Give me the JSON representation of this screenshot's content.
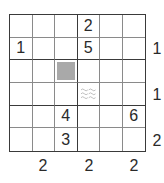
{
  "puzzle": {
    "rows": 6,
    "cols": 6,
    "box_rows": 2,
    "box_cols": 3,
    "colors": {
      "grid_line_thick": "#3a3a3a",
      "grid_line_thin": "#8a8a8a",
      "shaded_cell": "#a9a9a9",
      "water_symbol": "#b5b5b5",
      "digit": "#2a2a2a",
      "background": "#ffffff"
    },
    "cells": [
      [
        "",
        "",
        "",
        "2",
        "",
        ""
      ],
      [
        "1",
        "",
        "",
        "5",
        "",
        ""
      ],
      [
        "",
        "",
        "",
        "",
        "",
        ""
      ],
      [
        "",
        "",
        "",
        "",
        "",
        ""
      ],
      [
        "",
        "",
        "4",
        "",
        "",
        "6"
      ],
      [
        "",
        "",
        "3",
        "",
        "",
        ""
      ]
    ],
    "shaded_cells": [
      {
        "row": 3,
        "col": 3,
        "icon": "shaded-block"
      }
    ],
    "special_cells": [
      {
        "row": 4,
        "col": 4,
        "icon": "water-wave-icon"
      }
    ],
    "right_clues": [
      {
        "row": 2,
        "value": "1"
      },
      {
        "row": 4,
        "value": "1"
      },
      {
        "row": 6,
        "value": "2"
      }
    ],
    "bottom_clues": [
      {
        "col": 2,
        "value": "2"
      },
      {
        "col": 4,
        "value": "2"
      },
      {
        "col": 6,
        "value": "2"
      }
    ]
  }
}
